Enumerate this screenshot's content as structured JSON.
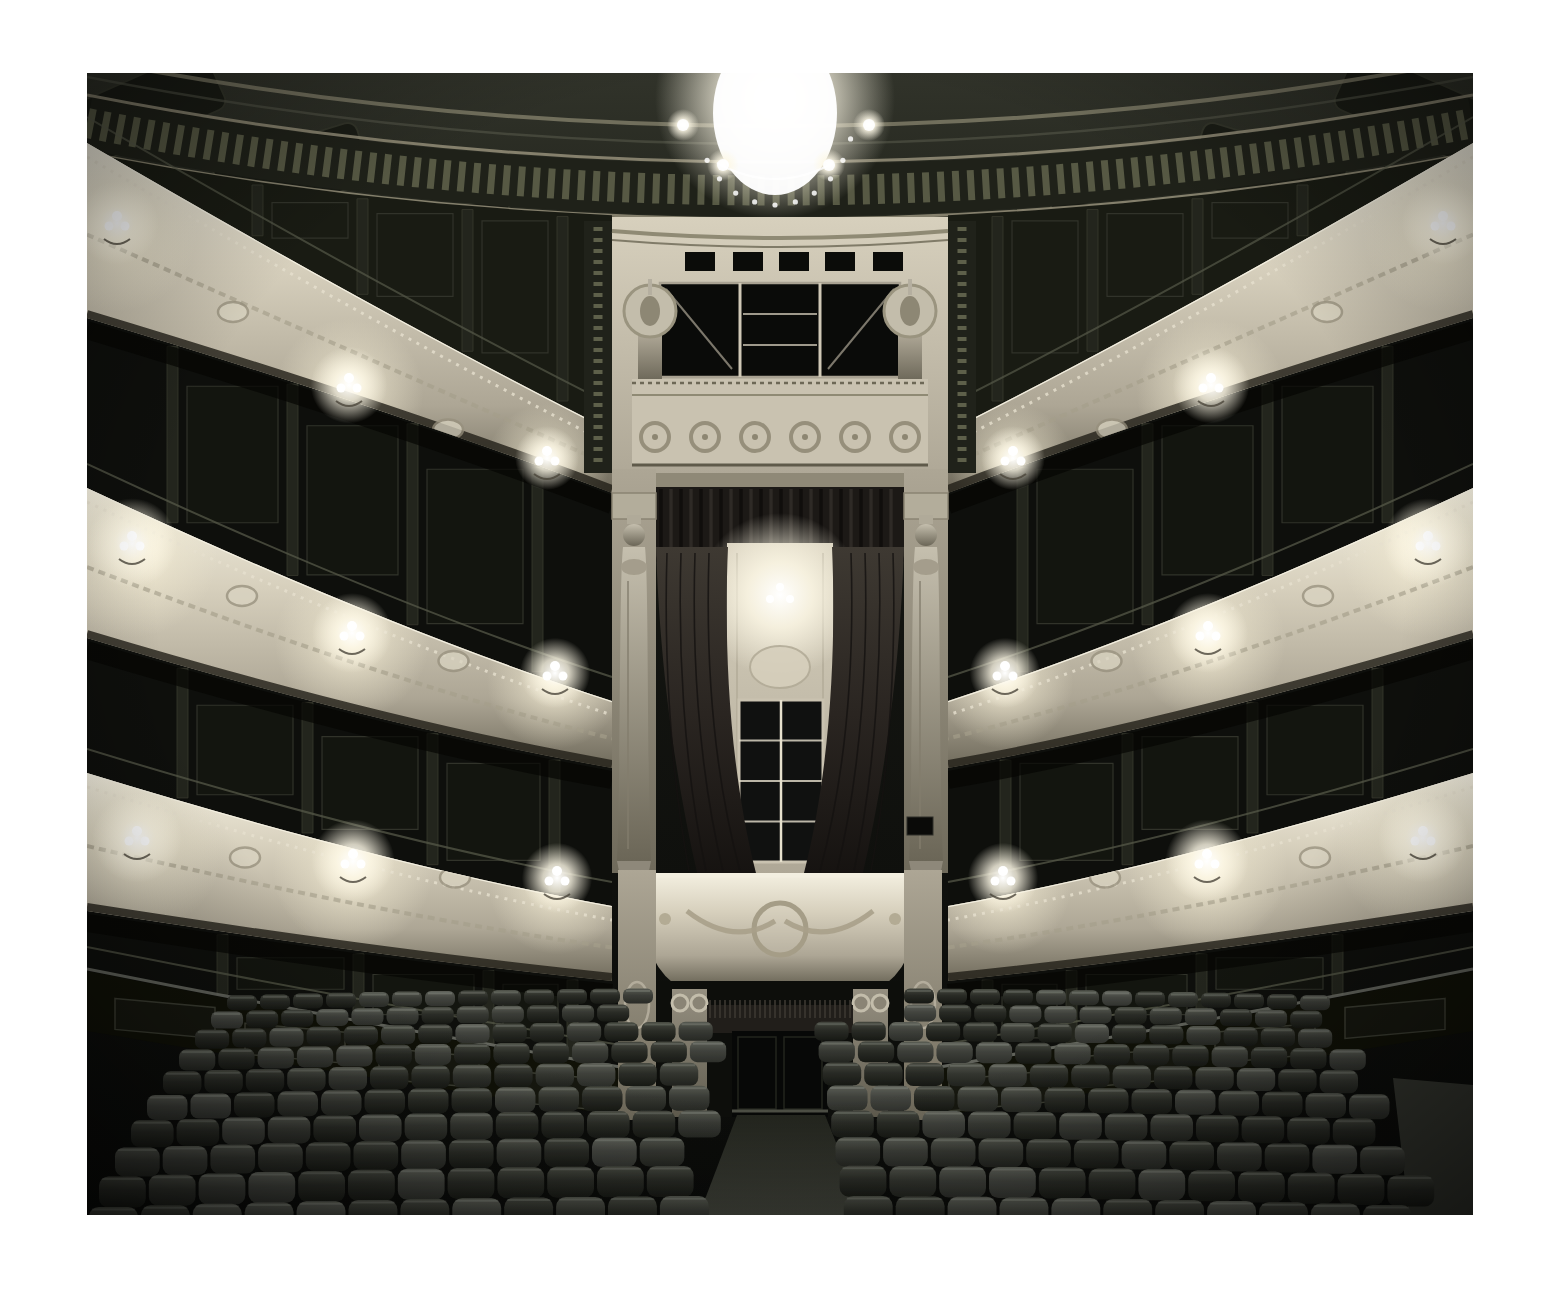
{
  "page": {
    "background": "#ffffff"
  },
  "photo": {
    "subject": "empty-historic-opera-house-auditorium",
    "x": 87,
    "y": 73,
    "width": 1386,
    "height": 1142
  },
  "palette": {
    "paper_white": "#ffffff",
    "bg_top": "#31332a",
    "bg_upper": "#21231b",
    "bg_mid": "#141511",
    "bg_low": "#0a0b09",
    "cream_hi": "#f4f0e1",
    "cream": "#d7d0bd",
    "cream_mid": "#ada695",
    "cream_dk": "#6f6a5b",
    "gold_trim": "#8f8a74",
    "frieze_dark": "#1f2119",
    "frieze_dot": "#5d5f49",
    "gallery_wall": "#191b13",
    "box_dark": "#0e0f0c",
    "panel_line": "#31332a",
    "divider": "#23251d",
    "rail": "#565848",
    "curtain_hi": "#3e3932",
    "curtain": "#2a2521",
    "curtain_dark": "#151210",
    "seat_hi": "#4c4f46",
    "seat_mid": "#2d2f29",
    "seat_dark": "#191b16",
    "floor": "#3d3f37",
    "aisle_dark": "#23251e",
    "statue_hi": "#c5bfae",
    "statue_dk": "#6b6657",
    "glow_warm": "#fdf8e6",
    "glow_core": "#ffffff"
  },
  "scene": {
    "dome": {
      "inner": [
        [
          0,
          -14
        ],
        [
          683,
          120
        ],
        [
          1386,
          -14
        ]
      ],
      "frieze_mid": [
        [
          0,
          50
        ],
        [
          683,
          185
        ],
        [
          1386,
          50
        ]
      ],
      "frieze_width": 52,
      "edge_top": [
        [
          0,
          22
        ],
        [
          683,
          156
        ],
        [
          1386,
          22
        ]
      ],
      "edge_bottom": [
        [
          0,
          80
        ],
        [
          683,
          212
        ],
        [
          1386,
          80
        ]
      ],
      "lower": [
        [
          0,
          100
        ],
        [
          683,
          235
        ],
        [
          1386,
          100
        ]
      ],
      "coffers": [
        [
          60,
          34,
          -24
        ],
        [
          205,
          100,
          -17
        ],
        [
          352,
          168,
          -10
        ]
      ],
      "coffer_w": 150,
      "coffer_h": 64
    },
    "chandelier": {
      "cx": 688,
      "cy": 26,
      "glow_r": 120,
      "body_rx": 62,
      "body_ry": 82,
      "satellites": [
        [
          596,
          52
        ],
        [
          782,
          52
        ],
        [
          636,
          92
        ],
        [
          742,
          92
        ]
      ]
    },
    "tiers": [
      {
        "name": "gallery",
        "top": [
          [
            0,
            70
          ],
          [
            300,
            245
          ],
          [
            525,
            358
          ]
        ],
        "bottom": [
          [
            0,
            245
          ],
          [
            300,
            335
          ],
          [
            525,
            420
          ]
        ],
        "sconces": [
          [
            30,
            150,
            26
          ],
          [
            262,
            312,
            24
          ],
          [
            460,
            385,
            20
          ]
        ]
      },
      {
        "name": "second-tier",
        "top": [
          [
            0,
            415
          ],
          [
            300,
            555
          ],
          [
            525,
            628
          ]
        ],
        "bottom": [
          [
            0,
            565
          ],
          [
            300,
            655
          ],
          [
            525,
            695
          ]
        ],
        "sconces": [
          [
            45,
            470,
            28
          ],
          [
            265,
            560,
            25
          ],
          [
            468,
            600,
            22
          ]
        ]
      },
      {
        "name": "first-tier",
        "top": [
          [
            0,
            700
          ],
          [
            300,
            792
          ],
          [
            525,
            833
          ]
        ],
        "bottom": [
          [
            0,
            838
          ],
          [
            300,
            885
          ],
          [
            525,
            908
          ]
        ],
        "sconces": [
          [
            50,
            765,
            28
          ],
          [
            266,
            788,
            26
          ],
          [
            470,
            805,
            22
          ]
        ]
      }
    ],
    "zone_divs": [
      [
        165,
        270,
        375,
        470
      ],
      [
        80,
        200,
        320,
        445
      ],
      [
        90,
        215,
        340,
        462
      ],
      [
        130,
        266,
        396,
        480
      ]
    ],
    "barrier": {
      "rail": [
        [
          0,
          898
        ],
        [
          270,
          952
        ],
        [
          569,
          1002
        ]
      ],
      "panel_xs": [
        28,
        158,
        292,
        424
      ]
    },
    "royal_box": {
      "cx": 693,
      "bay": {
        "x": 525,
        "width": 336,
        "top": 144,
        "bottom": 414
      },
      "slits": {
        "y": 179,
        "h": 19,
        "xs": [
          598,
          646,
          692,
          738,
          786
        ],
        "w": 30
      },
      "window": {
        "x": 573,
        "y": 210,
        "w": 240,
        "h": 94,
        "mullions": [
          653,
          733
        ]
      },
      "urns": [
        563,
        823
      ],
      "parapet_bands": {
        "top": 306,
        "wreath_cy": 364,
        "wreath_r": 14,
        "wreath_x0": 568,
        "wreath_dx": 50,
        "wreath_count": 6,
        "bottom": 392
      },
      "opening": {
        "x": 569,
        "width": 248
      },
      "valance": {
        "top": 414,
        "bottom": 486
      },
      "curtain_bottom": 800,
      "interior": {
        "x": 640,
        "width": 106,
        "glow": [
          693,
          522
        ],
        "window": {
          "x": 652,
          "y": 627,
          "w": 84,
          "h": 162
        }
      },
      "caryatids": {
        "lx": 547,
        "rx": 839,
        "head_y": 462,
        "foot_y": 788
      },
      "parapet": {
        "x": 553,
        "width": 280,
        "top": 800,
        "bottom": 910
      },
      "niche": {
        "x": 569,
        "width": 248,
        "top": 908,
        "bottom": 1044
      },
      "door": {
        "x": 645,
        "width": 96,
        "top": 958
      }
    },
    "seating": {
      "rows": 10,
      "y0": 915,
      "dy": 15,
      "accel": 0.9,
      "w0": 30,
      "w_growth": 2.1,
      "h0": 15,
      "h_growth": 2.0,
      "gap": 3,
      "aisle_cx": 695,
      "aisle_half0": 24,
      "aisle_growth": 4.2,
      "left0": 140,
      "left_shift": 16,
      "right0": 1248,
      "right_shift": 14,
      "bow": 12,
      "jitter": 0.1
    }
  }
}
